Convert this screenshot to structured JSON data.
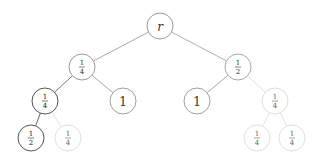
{
  "diagram": {
    "type": "tree",
    "nodes": [
      {
        "id": "r",
        "label": "r",
        "italic": true,
        "x": 160,
        "y": 26,
        "stroke": "#9a9a9a",
        "text": "#333333"
      },
      {
        "id": "L",
        "num": "1",
        "den": "4",
        "x": 82,
        "y": 67,
        "stroke": "#9a9a9a",
        "text": "#333333"
      },
      {
        "id": "R",
        "num": "1",
        "den": "2",
        "x": 238,
        "y": 67,
        "stroke": "#a8a8a8",
        "text": "#333333"
      },
      {
        "id": "LL",
        "num": "1",
        "den": "4",
        "x": 45,
        "y": 101,
        "stroke": "#555555",
        "text": "#222222"
      },
      {
        "id": "LR",
        "label": "1",
        "x": 123,
        "y": 101,
        "stroke": "#a0a0a0",
        "text": "#333333"
      },
      {
        "id": "RL",
        "label": "1",
        "x": 197,
        "y": 101,
        "stroke": "#a0a0a0",
        "text": "#333333"
      },
      {
        "id": "RR",
        "num": "1",
        "den": "4",
        "x": 275,
        "y": 101,
        "stroke": "#dcdcdc",
        "text": "#666666"
      },
      {
        "id": "LLL",
        "num": "1",
        "den": "2",
        "x": 31,
        "y": 138,
        "stroke": "#555555",
        "text": "#222222"
      },
      {
        "id": "LLR",
        "num": "1",
        "den": "4",
        "x": 68,
        "y": 138,
        "stroke": "#e0e0e0",
        "text": "#666666"
      },
      {
        "id": "RRL",
        "num": "1",
        "den": "4",
        "x": 257,
        "y": 138,
        "stroke": "#e0e0e0",
        "text": "#666666"
      },
      {
        "id": "RRR",
        "num": "1",
        "den": "4",
        "x": 292,
        "y": 138,
        "stroke": "#e0e0e0",
        "text": "#666666"
      }
    ],
    "edges": [
      {
        "from": "r",
        "to": "L",
        "color": "#a8a8a8"
      },
      {
        "from": "r",
        "to": "R",
        "color": "#b0b0b0"
      },
      {
        "from": "L",
        "to": "LL",
        "color": "#777777"
      },
      {
        "from": "L",
        "to": "LR",
        "color": "#a8a8a8"
      },
      {
        "from": "R",
        "to": "RL",
        "color": "#a8a8a8"
      },
      {
        "from": "R",
        "to": "RR",
        "color": "#e0e0e0"
      },
      {
        "from": "LL",
        "to": "LLL",
        "color": "#666666"
      },
      {
        "from": "LL",
        "to": "LLR",
        "color": "#e4e4e4"
      },
      {
        "from": "RR",
        "to": "RRL",
        "color": "#e4e4e4"
      },
      {
        "from": "RR",
        "to": "RRR",
        "color": "#e4e4e4"
      }
    ],
    "node_radius": 13
  }
}
